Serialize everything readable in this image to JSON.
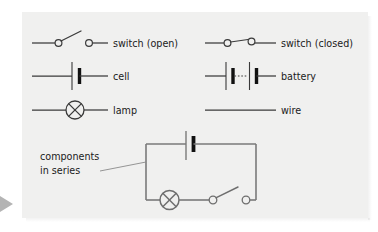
{
  "figure": {
    "background_color": "#ffffff",
    "panel_color": "#f0f0ef",
    "ink_color": "#3a3a3a",
    "circuit_ink_color": "#7a7a7a",
    "plate_color": "#111111"
  },
  "legend": {
    "rows": [
      {
        "left": {
          "symbol": "switch-open",
          "label": "switch (open)"
        },
        "right": {
          "symbol": "switch-closed",
          "label": "switch (closed)"
        }
      },
      {
        "left": {
          "symbol": "cell",
          "label": "cell"
        },
        "right": {
          "symbol": "battery",
          "label": "battery"
        }
      },
      {
        "left": {
          "symbol": "lamp",
          "label": "lamp"
        },
        "right": {
          "symbol": "wire",
          "label": "wire"
        }
      }
    ]
  },
  "circuit": {
    "annotation": {
      "line1": "components",
      "line2": "in series"
    },
    "components": [
      {
        "symbol": "cell",
        "position": "top"
      },
      {
        "symbol": "lamp",
        "position": "bottom-left"
      },
      {
        "symbol": "switch-open",
        "position": "bottom-right"
      }
    ]
  },
  "marker": {
    "left_arrow": "play-triangle-right"
  }
}
